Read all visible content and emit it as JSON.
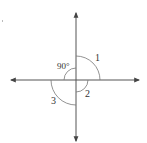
{
  "diagram": {
    "labels": {
      "angle1": "1",
      "angle90": "90°",
      "angle2": "2",
      "angle3": "3"
    },
    "colors": {
      "stroke": "#555555",
      "arc": "#777777",
      "text": "#333333"
    }
  }
}
